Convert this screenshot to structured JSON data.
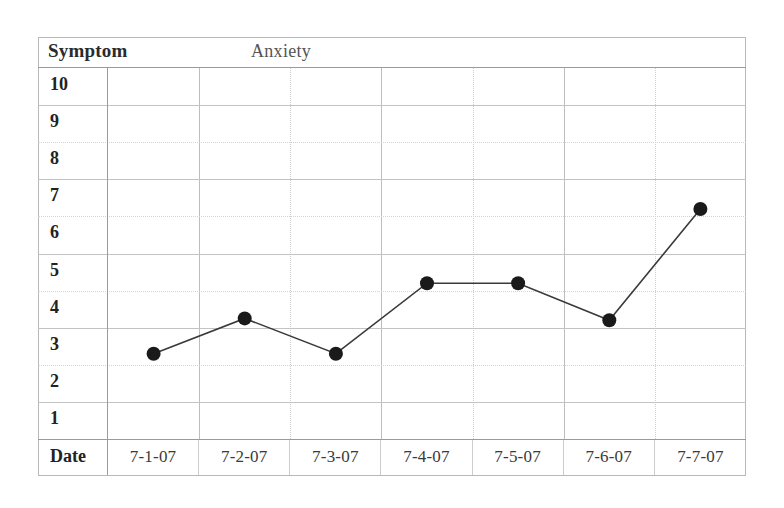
{
  "sheet": {
    "symptom_label": "Symptom",
    "topic_label": "Anxiety",
    "date_row_label": "Date"
  },
  "chart_data": {
    "type": "line",
    "title": "Anxiety",
    "xlabel": "Date",
    "ylabel": "Symptom",
    "categories": [
      "7-1-07",
      "7-2-07",
      "7-3-07",
      "7-4-07",
      "7-5-07",
      "7-6-07",
      "7-7-07"
    ],
    "values": [
      2.8,
      3.75,
      2.8,
      4.7,
      4.7,
      3.7,
      6.7
    ],
    "ylim": [
      0,
      10
    ],
    "y_ticks": [
      "10",
      "9",
      "8",
      "7",
      "6",
      "5",
      "4",
      "3",
      "2",
      "1"
    ],
    "grid": true,
    "legend": "none",
    "marker": "filled-circle",
    "marker_color": "#1a1a1a",
    "line_color": "#3a3a3a"
  }
}
